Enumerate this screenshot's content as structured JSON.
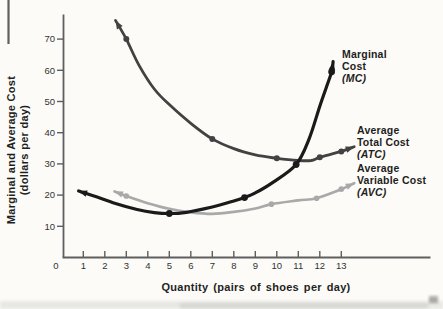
{
  "figure": {
    "y_axis_title_line1": "Marginal and Average Cost",
    "y_axis_title_line2": "(dollars per day)",
    "x_axis_title": "Quantity (pairs of shoes per day)",
    "origin_label": "0",
    "labels": {
      "mc": {
        "line1": "Marginal",
        "line2": "Cost",
        "abbr": "(MC)"
      },
      "atc": {
        "line1": "Average",
        "line2": "Total Cost",
        "abbr": "(ATC)"
      },
      "avc": {
        "line1": "Average",
        "line2": "Variable Cost",
        "abbr": "(AVC)"
      }
    },
    "colors": {
      "mc": "#1a1a1a",
      "atc": "#424242",
      "avc": "#a9a9a9",
      "axis": "#5f5f5f",
      "text": "#2b2b2b",
      "paper": "#fcfbf7"
    }
  },
  "chart_data": {
    "type": "line",
    "title": "",
    "xlabel": "Quantity (pairs of shoes per day)",
    "ylabel": "Marginal and Average Cost (dollars per day)",
    "x_ticks": [
      0,
      1,
      2,
      3,
      4,
      5,
      6,
      7,
      8,
      9,
      10,
      11,
      12,
      13
    ],
    "y_ticks": [
      10,
      20,
      30,
      40,
      50,
      60,
      70
    ],
    "xlim": [
      0,
      17
    ],
    "ylim": [
      0,
      78
    ],
    "grid": false,
    "legend_position": "inline-labels-right",
    "series": [
      {
        "id": "mc",
        "name": "Marginal Cost (MC)",
        "color": "#1a1a1a",
        "arrow_both_ends": true,
        "points": [
          [
            0.78,
            21.3
          ],
          [
            1.5,
            19.7
          ],
          [
            2.5,
            17.3
          ],
          [
            3.5,
            15.4
          ],
          [
            4.3,
            14.4
          ],
          [
            5,
            14.1
          ],
          [
            5.8,
            14.5
          ],
          [
            7,
            16.2
          ],
          [
            8,
            18.1
          ],
          [
            8.5,
            19.2
          ],
          [
            9,
            20.7
          ],
          [
            9.8,
            24.0
          ],
          [
            10.9,
            29.8
          ],
          [
            11.5,
            38
          ],
          [
            12,
            48.5
          ],
          [
            12.3,
            54.5
          ],
          [
            12.55,
            59.5
          ],
          [
            12.62,
            62.8
          ]
        ],
        "marked_points": [
          [
            5,
            14.1
          ],
          [
            8.5,
            19.2
          ],
          [
            10.9,
            29.8
          ],
          [
            12.55,
            59.5
          ]
        ]
      },
      {
        "id": "atc",
        "name": "Average Total Cost (ATC)",
        "color": "#424242",
        "arrow_both_ends": true,
        "points": [
          [
            2.5,
            76
          ],
          [
            3,
            70
          ],
          [
            3.6,
            61.5
          ],
          [
            4.3,
            54
          ],
          [
            5,
            49
          ],
          [
            6,
            43
          ],
          [
            7,
            38
          ],
          [
            8,
            34.9
          ],
          [
            9,
            32.9
          ],
          [
            10,
            31.8
          ],
          [
            11,
            31.1
          ],
          [
            11.6,
            31.1
          ],
          [
            12,
            32.1
          ],
          [
            13,
            34
          ],
          [
            13.6,
            35.5
          ]
        ],
        "marked_points": [
          [
            3,
            70
          ],
          [
            7,
            38
          ],
          [
            10,
            31.8
          ],
          [
            12,
            32.1
          ],
          [
            13,
            34
          ]
        ]
      },
      {
        "id": "avc",
        "name": "Average Variable Cost (AVC)",
        "color": "#a9a9a9",
        "arrow_both_ends": true,
        "points": [
          [
            2.45,
            21.2
          ],
          [
            3,
            19.7
          ],
          [
            4,
            17.4
          ],
          [
            5,
            15.6
          ],
          [
            6,
            14.5
          ],
          [
            7,
            14.0
          ],
          [
            8,
            14.6
          ],
          [
            9,
            15.7
          ],
          [
            9.75,
            17.1
          ],
          [
            11,
            18.3
          ],
          [
            11.85,
            19.0
          ],
          [
            13,
            21.9
          ],
          [
            13.6,
            23.8
          ]
        ],
        "marked_points": [
          [
            3,
            19.7
          ],
          [
            9.75,
            17.1
          ],
          [
            11.85,
            19.0
          ],
          [
            13,
            21.9
          ]
        ]
      }
    ]
  }
}
